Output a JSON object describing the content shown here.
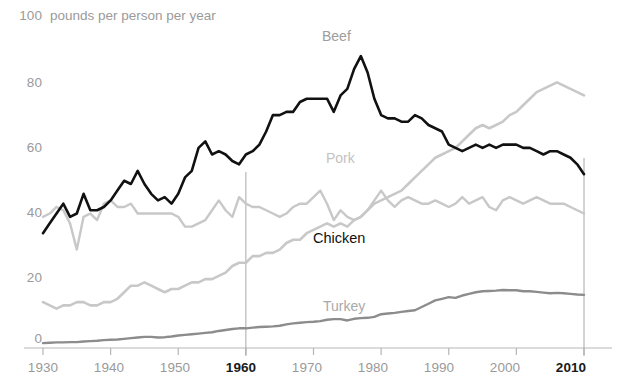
{
  "header": {
    "axis_top_value": "100",
    "unit_text": "pounds per person per year"
  },
  "axis": {
    "y_ticks": [
      "100",
      "80",
      "60",
      "40",
      "20",
      "0"
    ],
    "x_ticks": [
      "1930",
      "1940",
      "1950",
      "1960",
      "1970",
      "1980",
      "1990",
      "2000",
      "2010"
    ],
    "x_highlight": [
      "1960",
      "2010"
    ]
  },
  "labels": {
    "beef": "Beef",
    "pork": "Pork",
    "chicken": "Chicken",
    "turkey": "Turkey"
  },
  "colors": {
    "beef": "#111111",
    "pork": "#c8c8c8",
    "chicken": "#c8c8c8",
    "turkey": "#8c8c8c",
    "axis": "#b5b5b5",
    "tick_text": "#9a9a9a",
    "highlight_text": "#1a1a1a",
    "background": "#ffffff"
  },
  "chart_data": {
    "type": "line",
    "title": "",
    "xlabel": "",
    "ylabel": "pounds per person per year",
    "xlim": [
      1930,
      2010
    ],
    "ylim": [
      0,
      100
    ],
    "grid": false,
    "legend": "inline-labels",
    "x": [
      1930,
      1931,
      1932,
      1933,
      1934,
      1935,
      1936,
      1937,
      1938,
      1939,
      1940,
      1941,
      1942,
      1943,
      1944,
      1945,
      1946,
      1947,
      1948,
      1949,
      1950,
      1951,
      1952,
      1953,
      1954,
      1955,
      1956,
      1957,
      1958,
      1959,
      1960,
      1961,
      1962,
      1963,
      1964,
      1965,
      1966,
      1967,
      1968,
      1969,
      1970,
      1971,
      1972,
      1973,
      1974,
      1975,
      1976,
      1977,
      1978,
      1979,
      1980,
      1981,
      1982,
      1983,
      1984,
      1985,
      1986,
      1987,
      1988,
      1989,
      1990,
      1991,
      1992,
      1993,
      1994,
      1995,
      1996,
      1997,
      1998,
      1999,
      2000,
      2001,
      2002,
      2003,
      2004,
      2005,
      2006,
      2007,
      2008,
      2009,
      2010
    ],
    "series": [
      {
        "name": "Beef",
        "color": "#111111",
        "values": [
          35,
          38,
          41,
          44,
          40,
          41,
          47,
          42,
          42,
          43,
          45,
          48,
          51,
          50,
          54,
          50,
          47,
          45,
          46,
          44,
          47,
          52,
          54,
          61,
          63,
          59,
          60,
          59,
          57,
          56,
          59,
          60,
          62,
          66,
          71,
          71,
          72,
          72,
          75,
          76,
          76,
          76,
          76,
          72,
          77,
          79,
          85,
          89,
          84,
          76,
          71,
          70,
          70,
          69,
          69,
          71,
          70,
          68,
          67,
          66,
          62,
          61,
          60,
          61,
          62,
          61,
          62,
          61,
          62,
          62,
          62,
          61,
          61,
          60,
          59,
          60,
          60,
          59,
          58,
          56,
          53
        ]
      },
      {
        "name": "Pork",
        "color": "#c8c8c8",
        "values": [
          40,
          41,
          43,
          42,
          38,
          30,
          40,
          41,
          39,
          44,
          45,
          43,
          43,
          44,
          41,
          41,
          41,
          41,
          41,
          41,
          40,
          37,
          37,
          38,
          39,
          42,
          45,
          42,
          40,
          46,
          44,
          43,
          43,
          42,
          41,
          40,
          41,
          43,
          44,
          44,
          46,
          48,
          44,
          39,
          42,
          40,
          39,
          40,
          42,
          45,
          48,
          45,
          43,
          45,
          46,
          45,
          44,
          44,
          45,
          44,
          43,
          44,
          46,
          44,
          45,
          46,
          43,
          42,
          45,
          46,
          45,
          44,
          45,
          46,
          45,
          44,
          44,
          44,
          43,
          42,
          41
        ]
      },
      {
        "name": "Chicken",
        "color": "#c8c8c8",
        "values": [
          14,
          13,
          12,
          13,
          13,
          14,
          14,
          13,
          13,
          14,
          14,
          15,
          17,
          19,
          19,
          20,
          19,
          18,
          17,
          18,
          18,
          19,
          20,
          20,
          21,
          21,
          22,
          23,
          25,
          26,
          26,
          28,
          28,
          29,
          29,
          30,
          32,
          33,
          33,
          35,
          36,
          37,
          38,
          37,
          38,
          37,
          39,
          40,
          42,
          44,
          45,
          46,
          47,
          48,
          50,
          52,
          54,
          56,
          58,
          59,
          60,
          61,
          63,
          65,
          67,
          68,
          67,
          68,
          69,
          71,
          72,
          74,
          76,
          78,
          79,
          80,
          81,
          80,
          79,
          78,
          77
        ]
      },
      {
        "name": "Turkey",
        "color": "#8c8c8c",
        "values": [
          1.5,
          1.6,
          1.7,
          1.7,
          1.8,
          1.8,
          2,
          2.1,
          2.2,
          2.4,
          2.5,
          2.6,
          2.8,
          3,
          3.2,
          3.4,
          3.4,
          3.2,
          3.3,
          3.5,
          3.8,
          4,
          4.2,
          4.4,
          4.6,
          4.8,
          5.2,
          5.5,
          5.8,
          6,
          6,
          6.2,
          6.4,
          6.5,
          6.6,
          6.8,
          7.2,
          7.5,
          7.7,
          7.9,
          8,
          8.2,
          8.6,
          8.8,
          8.8,
          8.4,
          8.9,
          9.1,
          9.2,
          9.5,
          10.3,
          10.5,
          10.7,
          11,
          11.3,
          11.5,
          12.5,
          13.5,
          14.5,
          15,
          15.5,
          15.3,
          16,
          16.5,
          17,
          17.3,
          17.4,
          17.5,
          17.7,
          17.6,
          17.6,
          17.3,
          17.3,
          17.1,
          16.9,
          16.7,
          16.8,
          16.7,
          16.5,
          16.3,
          16.2
        ]
      }
    ],
    "annotations": [
      {
        "text": "Beef",
        "x": 1974,
        "y": 95
      },
      {
        "text": "Pork",
        "x": 1974,
        "y": 53
      },
      {
        "text": "Chicken",
        "x": 1973,
        "y": 33
      },
      {
        "text": "Turkey",
        "x": 1977,
        "y": 13
      }
    ]
  }
}
